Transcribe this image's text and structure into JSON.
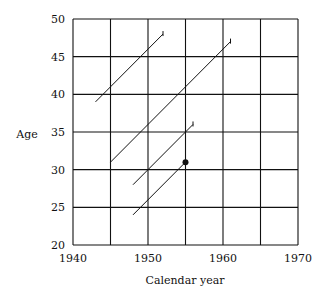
{
  "chart_data": {
    "type": "line",
    "title": "",
    "xlabel": "Calendar year",
    "ylabel": "Age",
    "xlim": [
      1940,
      1970
    ],
    "ylim": [
      20,
      50
    ],
    "xticks": [
      1940,
      1950,
      1960,
      1970
    ],
    "yticks": [
      20,
      25,
      30,
      35,
      40,
      45,
      50
    ],
    "grid": true,
    "grid_x_step": 5,
    "grid_y_step": 5,
    "legend": null,
    "series": [
      {
        "name": "life line 1",
        "points": [
          [
            1943,
            39
          ],
          [
            1952,
            48
          ]
        ],
        "end_marker": "tick"
      },
      {
        "name": "life line 2",
        "points": [
          [
            1945,
            31
          ],
          [
            1961,
            47
          ]
        ],
        "end_marker": "tick"
      },
      {
        "name": "life line 3",
        "points": [
          [
            1948,
            28
          ],
          [
            1956,
            36
          ]
        ],
        "end_marker": "tick"
      },
      {
        "name": "life line 4",
        "points": [
          [
            1948,
            24
          ],
          [
            1955,
            31
          ]
        ],
        "end_marker": "dot"
      }
    ]
  }
}
